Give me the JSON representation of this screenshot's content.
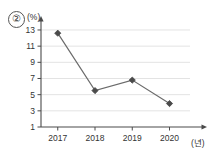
{
  "figure": {
    "item_number": "②",
    "y_axis_unit": "(%)",
    "x_axis_unit": "(년)"
  },
  "chart_data": {
    "type": "line",
    "title": "",
    "xlabel": "(년)",
    "ylabel": "(%)",
    "categories": [
      "2017",
      "2018",
      "2019",
      "2020"
    ],
    "x": [
      2017,
      2018,
      2019,
      2020
    ],
    "values": [
      12.6,
      5.5,
      6.8,
      3.9
    ],
    "series": [
      {
        "name": "",
        "values": [
          12.6,
          5.5,
          6.8,
          3.9
        ]
      }
    ],
    "ylim": [
      1,
      13.8
    ],
    "xlim": [
      2016.55,
      2020.55
    ],
    "yticks": [
      1,
      3,
      5,
      7,
      9,
      11,
      13
    ],
    "ytick_labels": [
      "1",
      "3",
      "5",
      "7",
      "9",
      "11",
      "13"
    ],
    "xtick_labels": [
      "2017",
      "2018",
      "2019",
      "2020"
    ],
    "grid": true,
    "grid_axis": "y",
    "legend": false,
    "legend_position": "none",
    "marker": "diamond",
    "line_color": "#6b6b6b",
    "marker_color": "#4a4a4a",
    "grid_color": "#e3e3e3",
    "axis_color": "#4a4a4a",
    "text_color": "#333333",
    "annotations": []
  }
}
